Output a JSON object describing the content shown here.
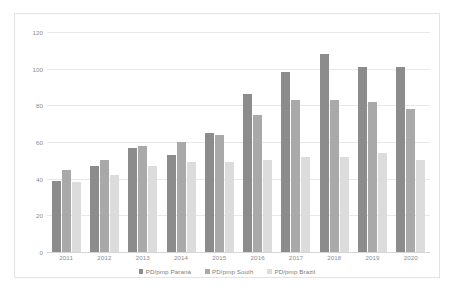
{
  "chart_data": {
    "type": "bar",
    "title": "",
    "subtitle": "",
    "xlabel": "",
    "ylabel": "",
    "categories": [
      "2011",
      "2012",
      "2013",
      "2014",
      "2015",
      "2016",
      "2017",
      "2018",
      "2019",
      "2020"
    ],
    "series": [
      {
        "name": "PD/pmp Paraná",
        "color": "#8c8c8c",
        "values": [
          39,
          47,
          57,
          53,
          65,
          86,
          98,
          108,
          101,
          101
        ]
      },
      {
        "name": "PD/pmp South",
        "color": "#a9a9a9",
        "values": [
          45,
          50,
          58,
          60,
          64,
          75,
          83,
          83,
          82,
          78
        ]
      },
      {
        "name": "PD/pmp Brazil",
        "color": "#dcdcdc",
        "values": [
          38,
          42,
          47,
          49,
          49,
          50,
          52,
          52,
          54,
          50
        ]
      }
    ],
    "ylim": [
      0,
      120
    ],
    "yticks": [
      0,
      20,
      40,
      60,
      80,
      100,
      120
    ],
    "ytick_labels": [
      "0",
      "20",
      "40",
      "60",
      "80",
      "100",
      "120"
    ],
    "grid": true,
    "legend_position": "bottom",
    "annotations": []
  }
}
